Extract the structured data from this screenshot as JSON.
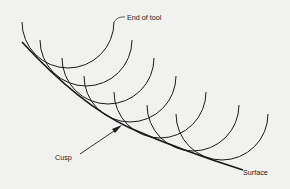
{
  "diagram": {
    "type": "tool-path-cusp-illustration",
    "labels": {
      "end_of_tool": "End of tool",
      "cusp": "Cusp",
      "surface": "Surface"
    },
    "colors": {
      "background": "#f1f1ef",
      "stroke": "#1a1a1a"
    },
    "tool_arcs": [
      {
        "cx": 68,
        "cy": 22,
        "r": 46
      },
      {
        "cx": 86,
        "cy": 40,
        "r": 46
      },
      {
        "cx": 108,
        "cy": 58,
        "r": 46
      },
      {
        "cx": 130,
        "cy": 76,
        "r": 46
      },
      {
        "cx": 160,
        "cy": 92,
        "r": 46
      },
      {
        "cx": 193,
        "cy": 105,
        "r": 46
      },
      {
        "cx": 222,
        "cy": 114,
        "r": 46
      }
    ],
    "tool_count": 7
  }
}
